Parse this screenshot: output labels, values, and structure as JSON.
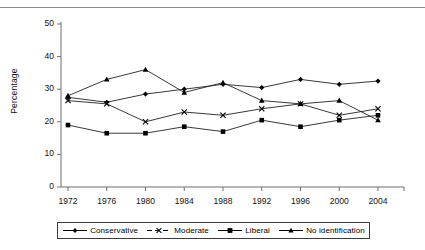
{
  "page": {
    "cut_header_text": "",
    "y_axis_title": "Percentage"
  },
  "legend": {
    "items": [
      {
        "label": "Conservative",
        "marker": "diamond-marker",
        "color": "#000000",
        "dashed": false
      },
      {
        "label": "Moderate",
        "marker": "cross-marker",
        "color": "#000000",
        "dashed": true
      },
      {
        "label": "Liberal",
        "marker": "square-marker",
        "color": "#000000",
        "dashed": false
      },
      {
        "label": "No identification",
        "marker": "triangle-marker",
        "color": "#000000",
        "dashed": false
      }
    ]
  },
  "chart_data": {
    "type": "line",
    "title": "",
    "xlabel": "",
    "ylabel": "Percentage",
    "ylim": [
      0,
      50
    ],
    "yticks": [
      0,
      10,
      20,
      30,
      40,
      50
    ],
    "grid": false,
    "legend_position": "bottom",
    "categories": [
      "1972",
      "1976",
      "1980",
      "1984",
      "1988",
      "1992",
      "1996",
      "2000",
      "2004"
    ],
    "series": [
      {
        "name": "Conservative",
        "marker": "diamond",
        "values": [
          27.5,
          26.0,
          28.5,
          30.0,
          31.5,
          30.5,
          33.0,
          31.5,
          32.5
        ]
      },
      {
        "name": "Moderate",
        "marker": "cross",
        "values": [
          26.5,
          25.5,
          20.0,
          23.0,
          22.0,
          24.0,
          25.5,
          22.0,
          24.0
        ]
      },
      {
        "name": "Liberal",
        "marker": "square",
        "values": [
          19.0,
          16.5,
          16.5,
          18.5,
          17.0,
          20.5,
          18.5,
          20.5,
          22.0
        ]
      },
      {
        "name": "No identification",
        "marker": "triangle",
        "values": [
          28.0,
          33.0,
          36.0,
          29.0,
          32.0,
          26.5,
          25.5,
          26.5,
          20.5
        ]
      }
    ]
  }
}
